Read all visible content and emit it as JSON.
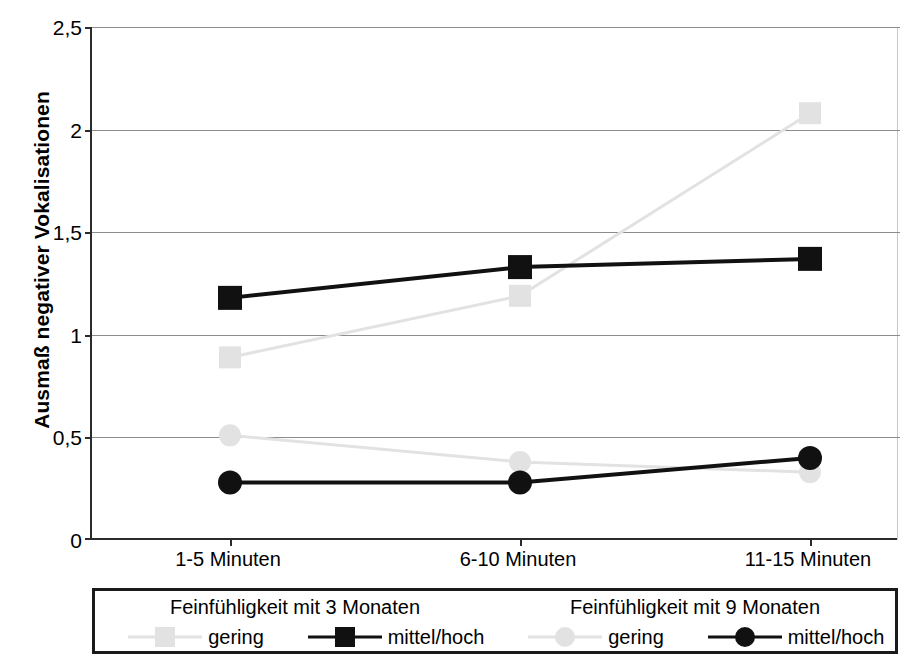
{
  "chart_data": {
    "type": "line",
    "title": "",
    "xlabel": "",
    "ylabel": "Ausmaß negativer Vokalisationen",
    "categories": [
      "1-5 Minuten",
      "6-10 Minuten",
      "11-15 Minuten"
    ],
    "ylim": [
      0,
      2.5
    ],
    "yticks": [
      "0",
      "0,5",
      "1",
      "1,5",
      "2",
      "2,5"
    ],
    "ytick_values": [
      0,
      0.5,
      1,
      1.5,
      2,
      2.5
    ],
    "grid": true,
    "legend_position": "below-plot",
    "series": [
      {
        "name": "Feinfühligkeit mit 3 Monaten – gering",
        "group": "Feinfühligkeit mit 3 Monaten",
        "level": "gering",
        "marker": "square",
        "color": "#e2e2e2",
        "values": [
          0.89,
          1.19,
          2.08
        ]
      },
      {
        "name": "Feinfühligkeit mit 3 Monaten – mittel/hoch",
        "group": "Feinfühligkeit mit 3 Monaten",
        "level": "mittel/hoch",
        "marker": "square",
        "color": "#111111",
        "values": [
          1.18,
          1.33,
          1.37
        ]
      },
      {
        "name": "Feinfühligkeit mit 9 Monaten – gering",
        "group": "Feinfühligkeit mit 9 Monaten",
        "level": "gering",
        "marker": "circle",
        "color": "#e2e2e2",
        "values": [
          0.51,
          0.38,
          0.33
        ]
      },
      {
        "name": "Feinfühligkeit mit 9 Monaten – mittel/hoch",
        "group": "Feinfühligkeit mit 9 Monaten",
        "level": "mittel/hoch",
        "marker": "circle",
        "color": "#111111",
        "values": [
          0.28,
          0.28,
          0.4
        ]
      }
    ]
  },
  "axis": {
    "y_title": "Ausmaß negativer Vokalisationen",
    "y_labels": {
      "t0": "0",
      "t1": "0,5",
      "t2": "1",
      "t3": "1,5",
      "t4": "2",
      "t5": "2,5"
    },
    "x_labels": {
      "c0": "1-5 Minuten",
      "c1": "6-10 Minuten",
      "c2": "11-15 Minuten"
    }
  },
  "legend": {
    "group_titles": {
      "left": "Feinfühligkeit mit 3 Monaten",
      "right": "Feinfühligkeit mit 9 Monaten"
    },
    "entries": [
      {
        "label": "gering",
        "marker": "square",
        "color": "#e2e2e2"
      },
      {
        "label": "mittel/hoch",
        "marker": "square",
        "color": "#111111"
      },
      {
        "label": "gering",
        "marker": "circle",
        "color": "#e2e2e2"
      },
      {
        "label": "mittel/hoch",
        "marker": "circle",
        "color": "#111111"
      }
    ]
  },
  "colors": {
    "light_gray": "#e2e2e2",
    "black": "#111111",
    "gridline": "#8c8c8c",
    "axis": "#2b2b2b",
    "frame": "#c9c9c9"
  }
}
